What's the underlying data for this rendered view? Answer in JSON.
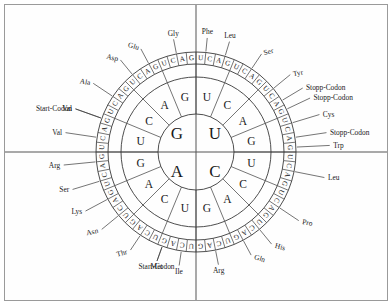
{
  "figure": {
    "center_x": 196,
    "center_y": 152,
    "radii": {
      "inner": 38,
      "ring1_outer": 38,
      "ring2_outer": 75,
      "ring3_outer": 100,
      "ring3_inner": 88
    },
    "colors": {
      "stroke": "#3a3a3a",
      "text": "#1a1a1a",
      "frame": "#9a9a9a",
      "background": "#ffffff",
      "axis": "#555555"
    }
  },
  "inner_bases": [
    {
      "label": "U",
      "quadrant": "top-right"
    },
    {
      "label": "C",
      "quadrant": "bottom-right"
    },
    {
      "label": "A",
      "quadrant": "bottom-left"
    },
    {
      "label": "G",
      "quadrant": "top-left"
    }
  ],
  "second_bases": [
    {
      "first": "U",
      "label": "U"
    },
    {
      "first": "U",
      "label": "C"
    },
    {
      "first": "U",
      "label": "A"
    },
    {
      "first": "U",
      "label": "G"
    },
    {
      "first": "C",
      "label": "U"
    },
    {
      "first": "C",
      "label": "C"
    },
    {
      "first": "C",
      "label": "A"
    },
    {
      "first": "C",
      "label": "G"
    },
    {
      "first": "A",
      "label": "U"
    },
    {
      "first": "A",
      "label": "C"
    },
    {
      "first": "A",
      "label": "A"
    },
    {
      "first": "A",
      "label": "G"
    },
    {
      "first": "G",
      "label": "U"
    },
    {
      "first": "G",
      "label": "C"
    },
    {
      "first": "G",
      "label": "A"
    },
    {
      "first": "G",
      "label": "G"
    }
  ],
  "third_bases": [
    "U",
    "C",
    "A",
    "G",
    "U",
    "C",
    "A",
    "G",
    "U",
    "C",
    "A",
    "G",
    "U",
    "C",
    "A",
    "G",
    "U",
    "C",
    "A",
    "G",
    "U",
    "C",
    "A",
    "G",
    "U",
    "C",
    "A",
    "G",
    "U",
    "C",
    "A",
    "G",
    "U",
    "C",
    "A",
    "G",
    "U",
    "C",
    "A",
    "G",
    "U",
    "C",
    "A",
    "G",
    "U",
    "C",
    "A",
    "G",
    "U",
    "C",
    "A",
    "G",
    "U",
    "C",
    "A",
    "G",
    "U",
    "C",
    "A",
    "G",
    "U",
    "C",
    "A",
    "G"
  ],
  "amino_acid_labels": [
    {
      "text": "Phe",
      "codons": [
        "UUU",
        "UUC"
      ],
      "slot_start": 0,
      "slot_span": 2
    },
    {
      "text": "Leu",
      "codons": [
        "UUA",
        "UUG"
      ],
      "slot_start": 2,
      "slot_span": 2
    },
    {
      "text": "Ser",
      "codons": [
        "UCU",
        "UCC",
        "UCA",
        "UCG"
      ],
      "slot_start": 4,
      "slot_span": 4
    },
    {
      "text": "Tyr",
      "codons": [
        "UAU",
        "UAC"
      ],
      "slot_start": 8,
      "slot_span": 2
    },
    {
      "text": "Stopp-Codon",
      "codons": [
        "UAA"
      ],
      "slot_start": 10,
      "slot_span": 1
    },
    {
      "text": "Stopp-Codon",
      "codons": [
        "UAG"
      ],
      "slot_start": 11,
      "slot_span": 1
    },
    {
      "text": "Cys",
      "codons": [
        "UGU",
        "UGC"
      ],
      "slot_start": 12,
      "slot_span": 2
    },
    {
      "text": "Stopp-Codon",
      "codons": [
        "UGA"
      ],
      "slot_start": 14,
      "slot_span": 1
    },
    {
      "text": "Trp",
      "codons": [
        "UGG"
      ],
      "slot_start": 15,
      "slot_span": 1
    },
    {
      "text": "Leu",
      "codons": [
        "CUU",
        "CUC",
        "CUA",
        "CUG"
      ],
      "slot_start": 16,
      "slot_span": 4
    },
    {
      "text": "Pro",
      "codons": [
        "CCU",
        "CCC",
        "CCA",
        "CCG"
      ],
      "slot_start": 20,
      "slot_span": 4
    },
    {
      "text": "His",
      "codons": [
        "CAU",
        "CAC"
      ],
      "slot_start": 24,
      "slot_span": 2
    },
    {
      "text": "Gln",
      "codons": [
        "CAA",
        "CAG"
      ],
      "slot_start": 26,
      "slot_span": 2
    },
    {
      "text": "Arg",
      "codons": [
        "CGU",
        "CGC",
        "CGA",
        "CGG"
      ],
      "slot_start": 28,
      "slot_span": 4
    },
    {
      "text": "Ile",
      "codons": [
        "AUU",
        "AUC",
        "AUA"
      ],
      "slot_start": 32,
      "slot_span": 3
    },
    {
      "text": "Met",
      "codons": [
        "AUG"
      ],
      "slot_start": 35,
      "slot_span": 1
    },
    {
      "text": "Start-Codon",
      "codons": [
        "AUG"
      ],
      "slot_start": 35,
      "slot_span": 1
    },
    {
      "text": "Thr",
      "codons": [
        "ACU",
        "ACC",
        "ACA",
        "ACG"
      ],
      "slot_start": 36,
      "slot_span": 4
    },
    {
      "text": "Asn",
      "codons": [
        "AAU",
        "AAC"
      ],
      "slot_start": 40,
      "slot_span": 2
    },
    {
      "text": "Lys",
      "codons": [
        "AAA",
        "AAG"
      ],
      "slot_start": 42,
      "slot_span": 2
    },
    {
      "text": "Ser",
      "codons": [
        "AGU",
        "AGC"
      ],
      "slot_start": 44,
      "slot_span": 2
    },
    {
      "text": "Arg",
      "codons": [
        "AGA",
        "AGG"
      ],
      "slot_start": 46,
      "slot_span": 2
    },
    {
      "text": "Val",
      "codons": [
        "GUU",
        "GUC",
        "GUA"
      ],
      "slot_start": 48,
      "slot_span": 3
    },
    {
      "text": "Val",
      "codons": [
        "GUG"
      ],
      "slot_start": 51,
      "slot_span": 1
    },
    {
      "text": "Start-Codon",
      "codons": [
        "GUG"
      ],
      "slot_start": 51,
      "slot_span": 1
    },
    {
      "text": "Ala",
      "codons": [
        "GCU",
        "GCC",
        "GCA",
        "GCG"
      ],
      "slot_start": 52,
      "slot_span": 4
    },
    {
      "text": "Asp",
      "codons": [
        "GAU",
        "GAC"
      ],
      "slot_start": 56,
      "slot_span": 2
    },
    {
      "text": "Glu",
      "codons": [
        "GAA",
        "GAG"
      ],
      "slot_start": 58,
      "slot_span": 2
    },
    {
      "text": "Gly",
      "codons": [
        "GGU",
        "GGC",
        "GGA",
        "GGG"
      ],
      "slot_start": 60,
      "slot_span": 4
    }
  ]
}
